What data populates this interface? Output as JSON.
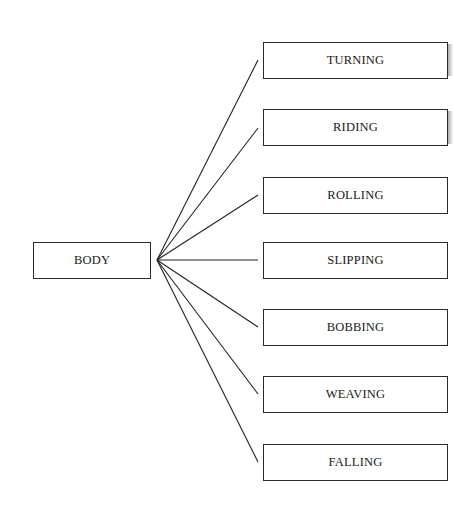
{
  "diagram": {
    "root": {
      "label": "BODY"
    },
    "children": [
      {
        "label": "TURNING"
      },
      {
        "label": "RIDING"
      },
      {
        "label": "ROLLING"
      },
      {
        "label": "SLIPPING"
      },
      {
        "label": "BOBBING"
      },
      {
        "label": "WEAVING"
      },
      {
        "label": "FALLING"
      }
    ]
  }
}
